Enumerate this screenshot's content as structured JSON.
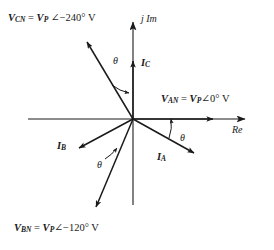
{
  "figure": {
    "type": "phasor-diagram",
    "axes": {
      "real": {
        "label": "Re",
        "direction": "right"
      },
      "imaginary": {
        "label": "j Im",
        "direction": "up"
      },
      "origin": {
        "x": 133,
        "y": 119
      }
    },
    "angle_symbol": "θ",
    "voltage_phasors": [
      {
        "name": "V_AN",
        "symbol": "V",
        "subscript": "AN",
        "magnitude": "V",
        "magnitude_subscript": "P",
        "angle_glyph": "∠",
        "angle": "0°",
        "unit": "V",
        "label_text": "V_AN = V_P ∠0° V",
        "direction_deg": 0
      },
      {
        "name": "V_BN",
        "symbol": "V",
        "subscript": "BN",
        "magnitude": "V",
        "magnitude_subscript": "P",
        "angle_glyph": "∠",
        "angle": "−120°",
        "unit": "V",
        "label_text": "V_BN = V_P ∠−120° V",
        "direction_deg": -120
      },
      {
        "name": "V_CN",
        "symbol": "V",
        "subscript": "CN",
        "magnitude": "V",
        "magnitude_subscript": "P",
        "angle_glyph": "∠",
        "angle": "−240°",
        "unit": "V",
        "label_text": "V_CN = V_P ∠−240° V",
        "direction_deg": -240
      }
    ],
    "current_phasors": [
      {
        "name": "I_A",
        "symbol": "I",
        "subscript": "A",
        "lag_angle": "θ"
      },
      {
        "name": "I_B",
        "symbol": "I",
        "subscript": "B",
        "lag_angle": "θ"
      },
      {
        "name": "I_C",
        "symbol": "I",
        "subscript": "C",
        "lag_angle": "θ"
      }
    ],
    "angle_marks": [
      {
        "id": "theta-c",
        "label": "θ",
        "between": "V_CN and I_C"
      },
      {
        "id": "theta-a",
        "label": "θ",
        "between": "I_A and Re axis"
      },
      {
        "id": "theta-b",
        "label": "θ",
        "between": "I_B and V_BN"
      }
    ],
    "colors": {
      "line": "#1a1a1a",
      "background": "#ffffff",
      "text": "#1a1a1a"
    }
  }
}
